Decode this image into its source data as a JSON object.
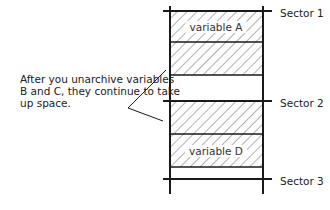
{
  "diagram": {
    "sectors": [
      {
        "label": "Sector 1",
        "y": 11
      },
      {
        "label": "Sector 2",
        "y": 101
      },
      {
        "label": "Sector 3",
        "y": 179
      }
    ],
    "blocks": [
      {
        "id": "A",
        "label": "variable A",
        "top": 11,
        "bottom": 42,
        "hatched": true
      },
      {
        "id": "B",
        "label": "",
        "top": 42,
        "bottom": 75,
        "hatched": true
      },
      {
        "id": "free1",
        "label": "",
        "top": 75,
        "bottom": 101,
        "hatched": false
      },
      {
        "id": "C",
        "label": "",
        "top": 101,
        "bottom": 134,
        "hatched": true
      },
      {
        "id": "D",
        "label": "variable D",
        "top": 134,
        "bottom": 167,
        "hatched": true
      },
      {
        "id": "free2",
        "label": "",
        "top": 167,
        "bottom": 179,
        "hatched": false
      }
    ],
    "callout": {
      "text": "After you unarchive variables B and C, they continue to take up space."
    },
    "colors": {
      "line": "#1a1a1a",
      "hatch": "#555555",
      "text": "#222222",
      "background": "#ffffff"
    }
  }
}
